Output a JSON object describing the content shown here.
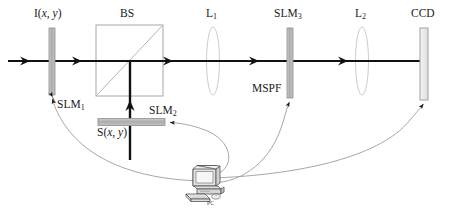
{
  "figure": {
    "type": "optical-setup-diagram",
    "background_color": "#ffffff",
    "beam_color": "#111111",
    "element_fill": "#b0b0b0",
    "element_stroke": "#8a8a8a",
    "lens_stroke": "#c9c9c9",
    "wire_color": "#9a9a9a"
  },
  "labels": {
    "input_field": {
      "base": "I(",
      "var1": "x",
      "comma": ", ",
      "var2": "y",
      "close": ")"
    },
    "beam_splitter": "BS",
    "lens1": {
      "base": "L",
      "sub": "1"
    },
    "lens2": {
      "base": "L",
      "sub": "2"
    },
    "slm1": {
      "base": "SLM",
      "sub": "1"
    },
    "slm2": {
      "base": "SLM",
      "sub": "2"
    },
    "slm3": {
      "base": "SLM",
      "sub": "3"
    },
    "mspf": "MSPF",
    "ccd": "CCD",
    "signal_field": {
      "base": "S(",
      "var1": "x",
      "comma": ", ",
      "var2": "y",
      "close": ")"
    },
    "pc": "PC"
  },
  "components": [
    {
      "name": "SLM1",
      "kind": "modulator",
      "x": 52,
      "top": 28,
      "bottom": 95,
      "width": 6
    },
    {
      "name": "BS",
      "kind": "beamsplitter",
      "x": 96,
      "y": 25,
      "w": 67,
      "h": 71
    },
    {
      "name": "L1",
      "kind": "lens",
      "x": 213,
      "cy": 61,
      "rx": 6.5,
      "ry": 34
    },
    {
      "name": "SLM3",
      "kind": "modulator",
      "x": 290,
      "top": 28,
      "bottom": 98,
      "width": 6
    },
    {
      "name": "L2",
      "kind": "lens",
      "x": 362,
      "cy": 61,
      "rx": 6.5,
      "ry": 34
    },
    {
      "name": "CCD",
      "kind": "detector",
      "x": 424,
      "top": 28,
      "bottom": 100,
      "width": 8
    },
    {
      "name": "SLM2",
      "kind": "modulator",
      "x1": 98,
      "x2": 165,
      "y": 122,
      "height": 7
    }
  ],
  "beams": [
    {
      "name": "input-beam",
      "from_x": 8,
      "to_x": 96,
      "y": 61,
      "arrows": [
        28,
        78
      ]
    },
    {
      "name": "bs-to-l1",
      "from_x": 130,
      "to_x": 213,
      "y": 61,
      "arrows": [
        170
      ]
    },
    {
      "name": "l1-to-slm3",
      "from_x": 213,
      "to_x": 290,
      "y": 61,
      "arrows": [
        258
      ]
    },
    {
      "name": "slm3-to-l2",
      "from_x": 290,
      "to_x": 362,
      "y": 61,
      "arrows": [
        348
      ]
    },
    {
      "name": "l2-to-ccd",
      "from_x": 362,
      "to_x": 424,
      "y": 61,
      "arrows": []
    },
    {
      "name": "signal-beam-vertical",
      "x": 130,
      "from_y": 160,
      "to_y": 61,
      "arrows": [
        104
      ]
    }
  ],
  "control_links": [
    {
      "name": "pc-to-slm1",
      "target": "SLM1"
    },
    {
      "name": "pc-to-slm2",
      "target": "SLM2"
    },
    {
      "name": "pc-to-slm3",
      "target": "SLM3"
    },
    {
      "name": "pc-to-ccd",
      "target": "CCD"
    }
  ]
}
